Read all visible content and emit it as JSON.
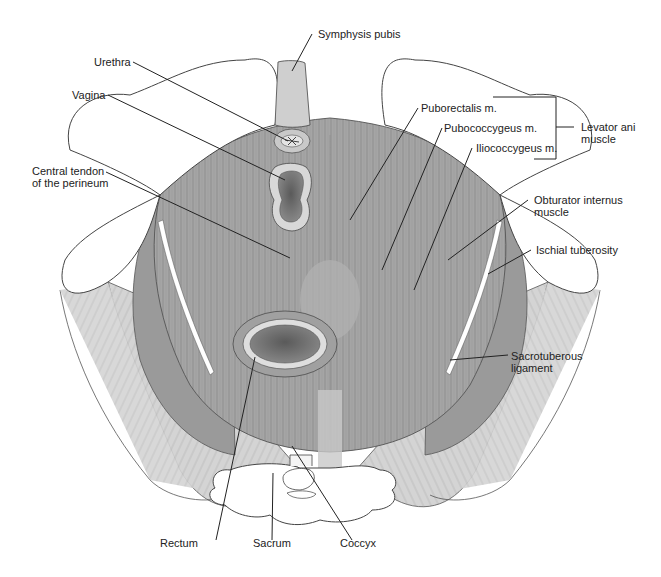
{
  "figure": {
    "colors": {
      "background": "#ffffff",
      "bone": "#ffffff",
      "bone_outline": "#444444",
      "muscle_dark": "#8f8f8f",
      "muscle_mid": "#a8a8a8",
      "muscle_light": "#c4c4c4",
      "ligament": "#dadada",
      "symphysis": "#cfcfcf",
      "leader_line": "#222222"
    }
  },
  "labels": {
    "symphysis_pubis": "Symphysis pubis",
    "urethra": "Urethra",
    "vagina": "Vagina",
    "central_tendon_1": "Central tendon",
    "central_tendon_2": "of the perineum",
    "puborectalis": "Puborectalis m.",
    "pubococcygeus": "Pubococcygeus m.",
    "iliococcygeus": "Iliococcygeus m.",
    "levator_ani_1": "Levator ani",
    "levator_ani_2": "muscle",
    "obturator_1": "Obturator internus",
    "obturator_2": "muscle",
    "ischial_tuberosity": "Ischial tuberosity",
    "sacrotuberous_1": "Sacrotuberous",
    "sacrotuberous_2": "ligament",
    "rectum": "Rectum",
    "sacrum": "Sacrum",
    "coccyx": "Coccyx"
  }
}
